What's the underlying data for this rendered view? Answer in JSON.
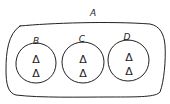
{
  "diagram": {
    "type": "set-containment",
    "outer_set": {
      "label": "A"
    },
    "inner_sets": [
      {
        "label": "B",
        "elements": [
          "Δ",
          "Δ"
        ]
      },
      {
        "label": "C",
        "elements": [
          "Δ",
          "Δ"
        ]
      },
      {
        "label": "D",
        "elements": [
          "Δ",
          "Δ"
        ]
      }
    ],
    "colors": {
      "stroke": "#222222",
      "background": "#ffffff"
    }
  }
}
